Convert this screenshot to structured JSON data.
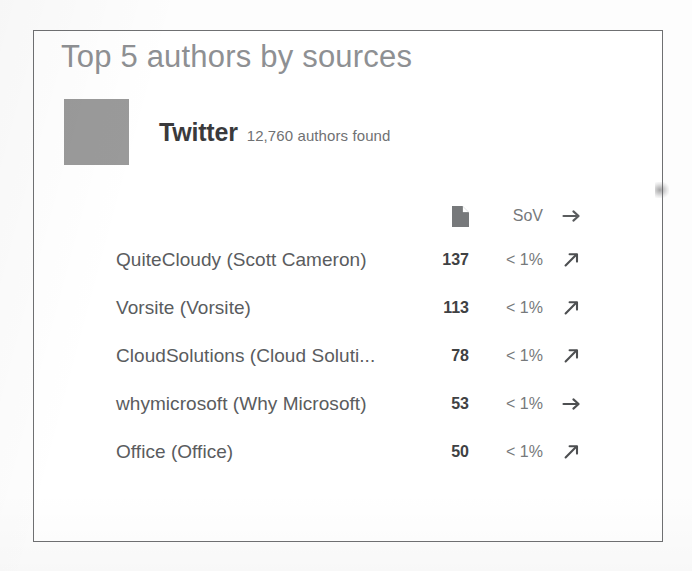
{
  "card": {
    "title": "Top 5 authors by sources",
    "source": {
      "logo_icon": "source-logo-placeholder",
      "name": "Twitter",
      "meta": "12,760 authors found"
    },
    "table": {
      "headers": {
        "name": "",
        "count_icon": "document-icon",
        "sov": "SoV",
        "trend_icon": "arrow-right-icon"
      },
      "rows": [
        {
          "name": "QuiteCloudy (Scott Cameron)",
          "count": "137",
          "sov": "< 1%",
          "trend_icon": "arrow-up-right-icon"
        },
        {
          "name": "Vorsite (Vorsite)",
          "count": "113",
          "sov": "< 1%",
          "trend_icon": "arrow-up-right-icon"
        },
        {
          "name": "CloudSolutions (Cloud Soluti...",
          "count": "78",
          "sov": "< 1%",
          "trend_icon": "arrow-up-right-icon"
        },
        {
          "name": "whymicrosoft (Why Microsoft)",
          "count": "53",
          "sov": "< 1%",
          "trend_icon": "arrow-right-icon"
        },
        {
          "name": "Office (Office)",
          "count": "50",
          "sov": "< 1%",
          "trend_icon": "arrow-up-right-icon"
        }
      ]
    }
  },
  "colors": {
    "title": "#8e9093",
    "body_text": "#5a5c5e",
    "emphasis_text": "#3a3a3c",
    "muted_text": "#76797b",
    "logo_placeholder": "#9a9a9a",
    "card_border": "#6f7072",
    "page_background": "#fdfdfd"
  }
}
